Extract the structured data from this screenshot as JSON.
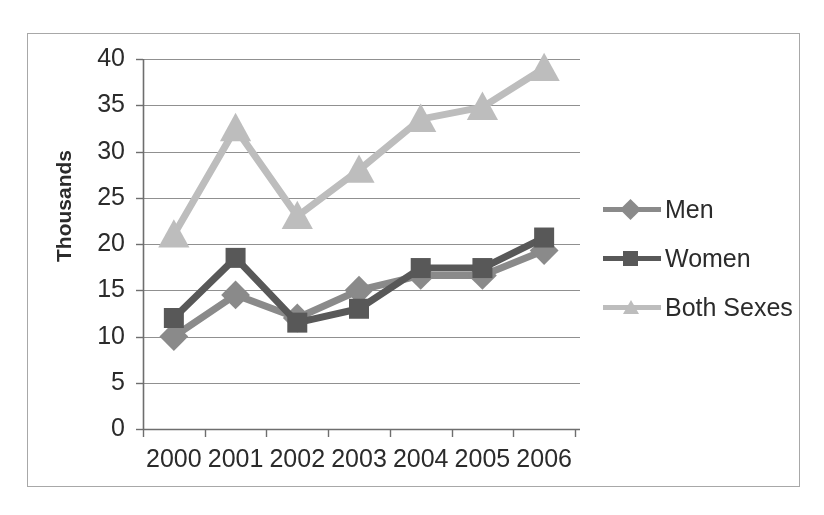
{
  "chart_data": {
    "type": "line",
    "title": "",
    "xlabel": "",
    "ylabel": "Thousands",
    "categories": [
      "2000",
      "2001",
      "2002",
      "2003",
      "2004",
      "2005",
      "2006"
    ],
    "x": [
      2000,
      2001,
      2002,
      2003,
      2004,
      2005,
      2006
    ],
    "ylim": [
      0,
      40
    ],
    "yticks": [
      0,
      5,
      10,
      15,
      20,
      25,
      30,
      35,
      40
    ],
    "ytick_labels": [
      "0",
      "5",
      "10",
      "15",
      "20",
      "25",
      "30",
      "35",
      "40"
    ],
    "grid": true,
    "grid_axis": "y",
    "legend_position": "right",
    "series": [
      {
        "name": "Men",
        "values": [
          10,
          14.5,
          12,
          15,
          16.6,
          16.6,
          19.3
        ],
        "color": "#8a8a8a",
        "marker": "diamond"
      },
      {
        "name": "Women",
        "values": [
          12,
          18.5,
          11.5,
          13,
          17.4,
          17.4,
          20.7
        ],
        "color": "#585858",
        "marker": "square"
      },
      {
        "name": "Both Sexes",
        "values": [
          21,
          32.5,
          23,
          28,
          33.5,
          34.8,
          39
        ],
        "color": "#bdbdbd",
        "marker": "triangle"
      }
    ]
  },
  "legend": {
    "items": [
      {
        "label": "Men"
      },
      {
        "label": "Women"
      },
      {
        "label": "Both Sexes"
      }
    ]
  },
  "axes": {
    "y_title": "Thousands"
  },
  "colors": {
    "frame_border": "#a8a8a8",
    "axis_line": "#6e6e6e",
    "grid_line": "#909090",
    "text": "#2b2b2b",
    "background": "#ffffff"
  }
}
